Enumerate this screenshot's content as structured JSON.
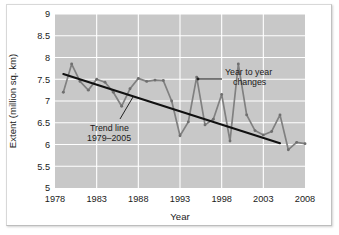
{
  "chart_data": {
    "type": "line",
    "title": "",
    "xlabel": "Year",
    "ylabel": "Extent (million sq. km)",
    "xlim": [
      1978,
      2008
    ],
    "ylim": [
      5,
      9
    ],
    "xticks": [
      "1978",
      "1983",
      "1988",
      "1993",
      "1998",
      "2003",
      "2008"
    ],
    "yticks": [
      "5",
      "5.5",
      "6",
      "6.5",
      "7",
      "7.5",
      "8",
      "8.5",
      "9"
    ],
    "grid": true,
    "legend": "none",
    "plot_bgcolor": "#c8c8c8",
    "grid_color": "#ffffff",
    "series": [
      {
        "name": "Year to year changes",
        "color": "#808080",
        "marker": true,
        "x": [
          1979,
          1980,
          1981,
          1982,
          1983,
          1984,
          1985,
          1986,
          1987,
          1988,
          1989,
          1990,
          1991,
          1992,
          1993,
          1994,
          1995,
          1996,
          1997,
          1998,
          1999,
          2000,
          2001,
          2002,
          2003,
          2004,
          2005
        ],
        "values": [
          7.2,
          7.85,
          7.45,
          7.25,
          7.5,
          7.43,
          7.2,
          6.88,
          7.28,
          7.52,
          7.45,
          7.48,
          7.47,
          7.0,
          6.2,
          6.52,
          7.55,
          6.45,
          6.58,
          7.15,
          6.08,
          7.85,
          6.68,
          6.32,
          6.22,
          6.3,
          6.68
        ]
      },
      {
        "name": "Trend line 1979-2005",
        "color": "#111111",
        "marker": false,
        "x": [
          1979,
          2005
        ],
        "values": [
          7.62,
          6.03
        ]
      }
    ],
    "series_tail": {
      "note": "continuation of year-to-year series after 2005 tick region",
      "x": [
        2006,
        2007,
        2008
      ],
      "values": [
        5.88,
        6.05,
        6.02
      ]
    },
    "annotations": [
      {
        "name": "year-to-year-changes",
        "line1": "Year to year",
        "line2": "changes",
        "leader": true
      },
      {
        "name": "trend-line",
        "line1": "Trend line",
        "line2": "1979–2005",
        "leader": true
      }
    ]
  },
  "axes": {
    "y_title": "Extent (million sq. km)",
    "x_title": "Year"
  },
  "ticks": {
    "y": [
      "9",
      "8.5",
      "8",
      "7.5",
      "7",
      "6.5",
      "6",
      "5.5",
      "5"
    ],
    "x": [
      "1978",
      "1983",
      "1988",
      "1993",
      "1998",
      "2003",
      "2008"
    ]
  },
  "annotation_text": {
    "yty_line1": "Year to year",
    "yty_line2": "changes",
    "trend_line1": "Trend line",
    "trend_line2": "1979–2005"
  }
}
